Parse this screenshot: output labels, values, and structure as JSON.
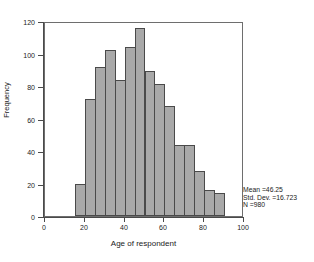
{
  "chart_data": {
    "type": "bar",
    "title": "",
    "xlabel": "Age of respondent",
    "ylabel": "Frequency",
    "xlim": [
      0,
      100
    ],
    "ylim": [
      0,
      120
    ],
    "grid": false,
    "legend_position": "none",
    "bin_width": 5,
    "bin_starts": [
      15,
      20,
      25,
      30,
      35,
      40,
      45,
      50,
      55,
      60,
      65,
      70,
      75,
      80,
      85
    ],
    "categories": [
      "15-20",
      "20-25",
      "25-30",
      "30-35",
      "35-40",
      "40-45",
      "45-50",
      "50-55",
      "55-60",
      "60-65",
      "65-70",
      "70-75",
      "75-80",
      "80-85",
      "85-90"
    ],
    "values": [
      20,
      72,
      92,
      102,
      84,
      104,
      116,
      89,
      81,
      68,
      44,
      44,
      28,
      16,
      14
    ],
    "x_ticks": [
      0,
      20,
      40,
      60,
      80,
      100
    ],
    "y_ticks": [
      0,
      20,
      40,
      60,
      80,
      100,
      120
    ],
    "bar_color": "#a9a9a9",
    "bar_border_color": "#4a4a4a",
    "annotations": {
      "mean": "Mean =46.25",
      "std_dev": "Std. Dev. =16.723",
      "n": "N =980"
    }
  },
  "axes": {
    "y_tick_labels": [
      "0",
      "20",
      "40",
      "60",
      "80",
      "100",
      "120"
    ],
    "x_tick_labels": [
      "0",
      "20",
      "40",
      "60",
      "80",
      "100"
    ],
    "y_title": "Frequency",
    "x_title": "Age of respondent"
  },
  "stats": {
    "mean": "Mean =46.25",
    "std_dev": "Std. Dev. =16.723",
    "n": "N =980"
  },
  "header": {
    "title": ""
  }
}
